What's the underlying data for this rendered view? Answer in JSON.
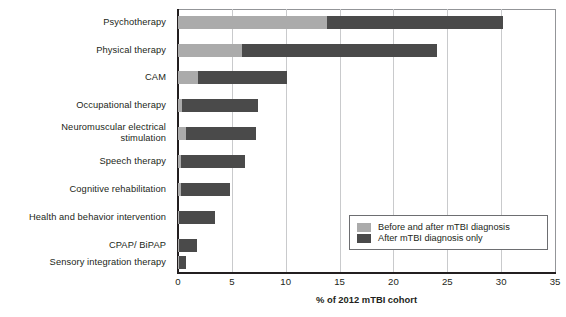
{
  "chart_data": {
    "type": "bar",
    "orientation": "horizontal",
    "stacked": true,
    "title": "",
    "xlabel": "% of 2012 mTBI cohort",
    "ylabel": "",
    "xlim": [
      0,
      35
    ],
    "xticks": [
      "0",
      "5",
      "10",
      "15",
      "20",
      "25",
      "30",
      "35"
    ],
    "grid": "vertical",
    "legend_position": "inside-bottom-right",
    "categories": [
      "Psychotherapy",
      "Physical therapy",
      "CAM",
      "Occupational therapy",
      "Neuromuscular electrical\nstimulation",
      "Speech therapy",
      "Cognitive rehabilitation",
      "Health and behavior intervention",
      "CPAP/ BiPAP",
      "Sensory integration therapy"
    ],
    "series": [
      {
        "name": "Before and after mTBI diagnosis",
        "color": "#ababab",
        "values": [
          13.8,
          5.9,
          1.9,
          0.4,
          0.7,
          0.3,
          0.3,
          0.1,
          0.1,
          0.1
        ]
      },
      {
        "name": "After mTBI diagnosis only",
        "color": "#4a4a4a",
        "values": [
          16.4,
          18.1,
          8.2,
          7.0,
          6.5,
          5.9,
          4.5,
          3.3,
          1.7,
          0.6
        ]
      }
    ],
    "totals": [
      30.2,
      24.0,
      10.1,
      7.4,
      7.2,
      6.2,
      4.8,
      3.4,
      1.8,
      0.7
    ]
  },
  "legend": {
    "items": [
      {
        "label": "Before and after mTBI diagnosis",
        "color": "#ababab"
      },
      {
        "label": "After mTBI diagnosis only",
        "color": "#4a4a4a"
      }
    ]
  },
  "axis": {
    "x_title": "% of 2012 mTBI cohort"
  }
}
